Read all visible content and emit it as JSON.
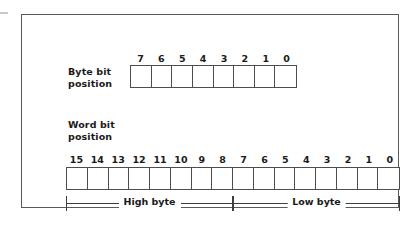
{
  "figure": {
    "background_color": "#ffffff",
    "border_color": "#5a5a5a",
    "line_color": "#4d4d4d",
    "text_color": "#1a1a1a"
  },
  "byte_row": {
    "label": "Byte bit\nposition",
    "bit_numbers": [
      "7",
      "6",
      "5",
      "4",
      "3",
      "2",
      "1",
      "0"
    ],
    "cell_count": 8,
    "cell_values": [
      "",
      "",
      "",
      "",
      "",
      "",
      "",
      ""
    ]
  },
  "word_row": {
    "label": "Word bit\nposition",
    "bit_numbers": [
      "15",
      "14",
      "13",
      "12",
      "11",
      "10",
      "9",
      "8",
      "7",
      "6",
      "5",
      "4",
      "3",
      "2",
      "1",
      "0"
    ],
    "cell_count": 16,
    "cell_values": [
      "",
      "",
      "",
      "",
      "",
      "",
      "",
      "",
      "",
      "",
      "",
      "",
      "",
      "",
      "",
      ""
    ]
  },
  "brackets": {
    "high_byte_label": "High byte",
    "low_byte_label": "Low byte"
  }
}
